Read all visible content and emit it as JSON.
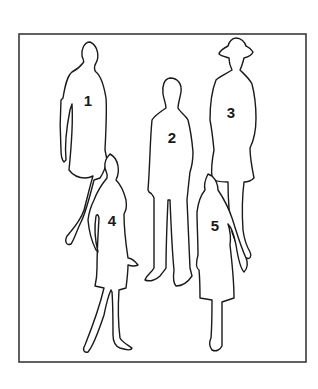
{
  "diagram": {
    "type": "numbered figure silhouettes",
    "frame": {
      "x": 19,
      "y": 34,
      "width": 287,
      "height": 328,
      "stroke": "#3a3a3a"
    },
    "colors": {
      "line": "#1a1a1a",
      "background": "#ffffff"
    },
    "figures": [
      {
        "id": 1,
        "label": "1",
        "description": "woman in short dress, arms at sides",
        "label_pos": [
          88,
          100
        ]
      },
      {
        "id": 2,
        "label": "2",
        "description": "man in trousers, standing",
        "label_pos": [
          172,
          137
        ]
      },
      {
        "id": 3,
        "label": "3",
        "description": "person wearing a hat and coat",
        "label_pos": [
          231,
          112
        ]
      },
      {
        "id": 4,
        "label": "4",
        "description": "woman in skirt, heeled shoes",
        "label_pos": [
          112,
          220
        ]
      },
      {
        "id": 5,
        "label": "5",
        "description": "woman in long skirt, heeled shoes",
        "label_pos": [
          215,
          225
        ]
      }
    ]
  }
}
